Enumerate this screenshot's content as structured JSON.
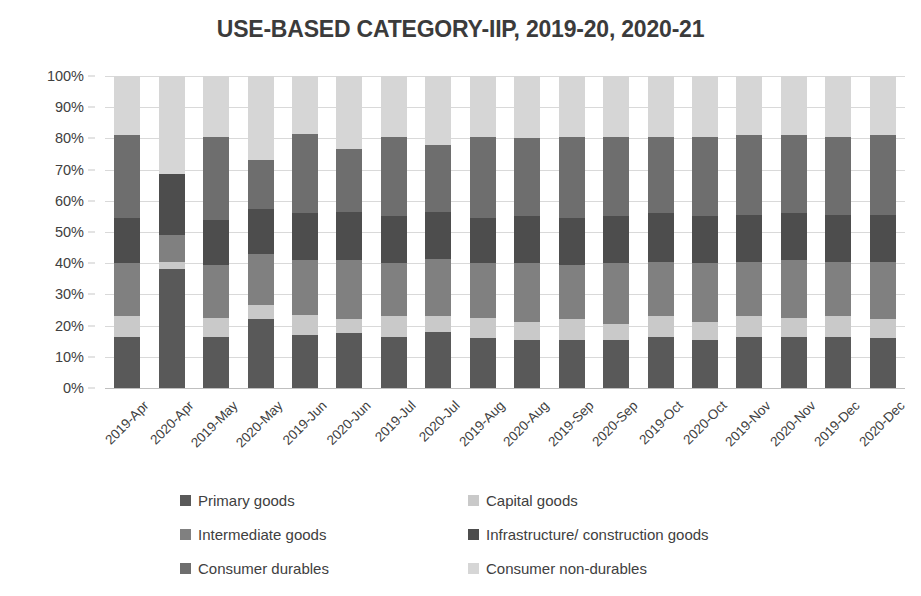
{
  "chart_data": {
    "type": "bar",
    "subtype": "stacked-100-percent",
    "title": "USE-BASED CATEGORY-IIP, 2019-20, 2020-21",
    "xlabel": "",
    "ylabel": "",
    "ylim": [
      0,
      100
    ],
    "ytick_labels": [
      "0%",
      "10%",
      "20%",
      "30%",
      "40%",
      "50%",
      "60%",
      "70%",
      "80%",
      "90%",
      "100%"
    ],
    "ytick_values": [
      0,
      10,
      20,
      30,
      40,
      50,
      60,
      70,
      80,
      90,
      100
    ],
    "grid": true,
    "legend_position": "bottom",
    "categories": [
      "2019-Apr",
      "2020-Apr",
      "2019-May",
      "2020-May",
      "2019-Jun",
      "2020-Jun",
      "2019-Jul",
      "2020-Jul",
      "2019-Aug",
      "2020-Aug",
      "2019-Sep",
      "2020-Sep",
      "2019-Oct",
      "2020-Oct",
      "2019-Nov",
      "2020-Nov",
      "2019-Dec",
      "2020-Dec"
    ],
    "series": [
      {
        "name": "Primary goods",
        "color": "#595959",
        "values": [
          16.5,
          38.0,
          16.5,
          22.0,
          17.0,
          17.5,
          16.5,
          18.0,
          16.0,
          15.5,
          15.5,
          15.5,
          16.5,
          15.5,
          16.5,
          16.5,
          16.5,
          16.0
        ]
      },
      {
        "name": "Capital goods",
        "color": "#c9c9c9",
        "values": [
          6.5,
          2.5,
          6.0,
          4.5,
          6.5,
          4.5,
          6.5,
          5.0,
          6.5,
          5.5,
          6.5,
          5.0,
          6.5,
          5.5,
          6.5,
          6.0,
          6.5,
          6.0
        ]
      },
      {
        "name": "Intermediate goods",
        "color": "#808080",
        "values": [
          17.0,
          8.5,
          17.0,
          16.5,
          17.5,
          19.0,
          17.0,
          18.5,
          17.5,
          19.0,
          17.5,
          19.5,
          17.5,
          19.0,
          17.5,
          18.5,
          17.5,
          18.5
        ]
      },
      {
        "name": "Infrastructure/ construction goods",
        "color": "#4d4d4d",
        "values": [
          14.5,
          19.5,
          14.5,
          14.5,
          15.0,
          15.5,
          15.0,
          15.0,
          14.5,
          15.0,
          15.0,
          15.0,
          15.5,
          15.0,
          15.0,
          15.0,
          15.0,
          15.0
        ]
      },
      {
        "name": "Consumer durables",
        "color": "#6e6e6e",
        "values": [
          26.5,
          0.0,
          26.5,
          15.5,
          25.5,
          20.0,
          25.5,
          21.5,
          26.0,
          25.0,
          26.0,
          25.5,
          24.5,
          25.5,
          25.5,
          25.0,
          25.0,
          25.5
        ]
      },
      {
        "name": "Consumer non-durables",
        "color": "#d6d6d6",
        "values": [
          19.0,
          31.5,
          19.5,
          27.0,
          18.5,
          23.5,
          19.5,
          22.0,
          19.5,
          20.0,
          19.5,
          19.5,
          19.5,
          19.5,
          19.0,
          19.0,
          19.5,
          19.0
        ]
      }
    ]
  },
  "legend": {
    "items": [
      {
        "label": "Primary goods",
        "color": "#595959",
        "col": 0,
        "row": 0
      },
      {
        "label": "Capital goods",
        "color": "#c9c9c9",
        "col": 1,
        "row": 0
      },
      {
        "label": "Intermediate goods",
        "color": "#808080",
        "col": 0,
        "row": 1
      },
      {
        "label": "Infrastructure/ construction goods",
        "color": "#4d4d4d",
        "col": 1,
        "row": 1
      },
      {
        "label": "Consumer durables",
        "color": "#6e6e6e",
        "col": 0,
        "row": 2
      },
      {
        "label": "Consumer non-durables",
        "color": "#d6d6d6",
        "col": 1,
        "row": 2
      }
    ]
  }
}
